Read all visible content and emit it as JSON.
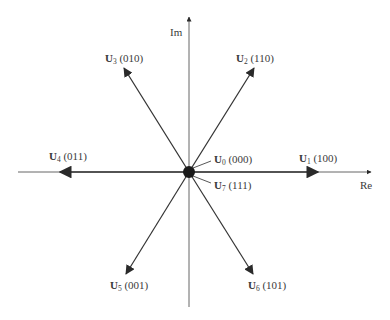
{
  "diagram": {
    "title": "",
    "axes": {
      "real_label": "Re",
      "imag_label": "Im"
    },
    "vectors": [
      {
        "name": "U",
        "sub": "0",
        "state": "(000)",
        "angle_deg": null,
        "zero": true
      },
      {
        "name": "U",
        "sub": "1",
        "state": "(100)",
        "angle_deg": 0
      },
      {
        "name": "U",
        "sub": "2",
        "state": "(110)",
        "angle_deg": 60
      },
      {
        "name": "U",
        "sub": "3",
        "state": "(010)",
        "angle_deg": 120
      },
      {
        "name": "U",
        "sub": "4",
        "state": "(011)",
        "angle_deg": 180
      },
      {
        "name": "U",
        "sub": "5",
        "state": "(001)",
        "angle_deg": 240
      },
      {
        "name": "U",
        "sub": "6",
        "state": "(101)",
        "angle_deg": 300
      },
      {
        "name": "U",
        "sub": "7",
        "state": "(111)",
        "angle_deg": null,
        "zero": true
      }
    ],
    "colors": {
      "line": "#555555",
      "arrow": "#2a2a2a",
      "text": "#3a3a3a"
    }
  }
}
